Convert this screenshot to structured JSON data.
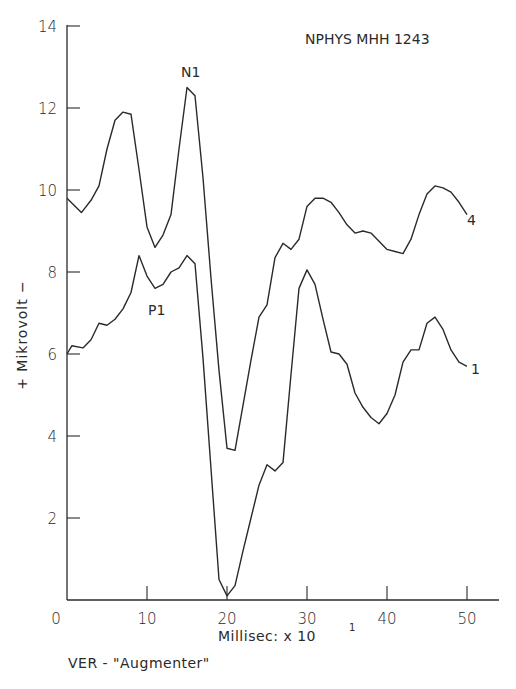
{
  "chart_data": {
    "type": "line",
    "title": "NPHYS MHH 1243",
    "caption": "VER - \"Augmenter\"",
    "xlabel": "Millisec: x 10",
    "xlabel_exponent": "1",
    "ylabel": "+ Mikrovolt −",
    "xlim": [
      0,
      54
    ],
    "ylim": [
      0,
      14
    ],
    "grid": false,
    "legend": "inline labels at curve ends",
    "x_ticks": [
      0,
      10,
      20,
      30,
      40,
      50
    ],
    "x_tick_labels": [
      "0",
      "10",
      "20",
      "30",
      "40",
      "50"
    ],
    "y_ticks": [
      2,
      4,
      6,
      8,
      10,
      12,
      14
    ],
    "y_tick_labels": [
      "2",
      "4",
      "6",
      "8",
      "10",
      "12",
      "14"
    ],
    "annotations": [
      {
        "text": "N1",
        "x": 15.4,
        "y": 13.0,
        "refers_to": "peak of curve 4"
      },
      {
        "text": "P1",
        "x": 11.4,
        "y": 7.2,
        "refers_to": "peak region of curve 1"
      }
    ],
    "series": [
      {
        "name": "4",
        "x": [
          0,
          1.8,
          3,
          4,
          5,
          6,
          7,
          8,
          9,
          10,
          11,
          12,
          13,
          14,
          15,
          16,
          17,
          18,
          19,
          20,
          21,
          22,
          23,
          24,
          25,
          26,
          27,
          28,
          29,
          30,
          31,
          32,
          33,
          34,
          35,
          36,
          37,
          38,
          39,
          40,
          41,
          42,
          43,
          44,
          45,
          46,
          47,
          48,
          49,
          50
        ],
        "values": [
          9.8,
          9.45,
          9.75,
          10.1,
          11.0,
          11.7,
          11.9,
          11.85,
          10.5,
          9.1,
          8.6,
          8.9,
          9.4,
          11.0,
          12.5,
          12.3,
          10.3,
          7.85,
          5.6,
          3.7,
          3.65,
          4.75,
          5.85,
          6.9,
          7.2,
          8.35,
          8.7,
          8.55,
          8.8,
          9.6,
          9.8,
          9.8,
          9.7,
          9.45,
          9.15,
          8.95,
          9.0,
          8.95,
          8.75,
          8.55,
          8.5,
          8.45,
          8.8,
          9.4,
          9.9,
          10.1,
          10.05,
          9.95,
          9.7,
          9.4
        ]
      },
      {
        "name": "1",
        "x": [
          0,
          0.6,
          2,
          3,
          4,
          5,
          6,
          7,
          8,
          9,
          10,
          11,
          12,
          13,
          14,
          15,
          16,
          17,
          18,
          19,
          20,
          21,
          22,
          23,
          24,
          25,
          26,
          27,
          28,
          29,
          30,
          31,
          32,
          33,
          34,
          35,
          36,
          37,
          38,
          39,
          40,
          41,
          42,
          43,
          44,
          45,
          46,
          47,
          48,
          49,
          50
        ],
        "values": [
          6.0,
          6.2,
          6.15,
          6.35,
          6.75,
          6.7,
          6.85,
          7.1,
          7.5,
          8.4,
          7.9,
          7.6,
          7.7,
          8.0,
          8.1,
          8.4,
          8.2,
          5.9,
          3.2,
          0.5,
          0.1,
          0.35,
          1.2,
          2.0,
          2.8,
          3.3,
          3.15,
          3.35,
          5.5,
          7.6,
          8.05,
          7.7,
          6.85,
          6.05,
          6.0,
          5.75,
          5.05,
          4.7,
          4.45,
          4.3,
          4.55,
          5.0,
          5.8,
          6.1,
          6.1,
          6.75,
          6.9,
          6.6,
          6.1,
          5.8,
          5.7
        ]
      }
    ]
  }
}
